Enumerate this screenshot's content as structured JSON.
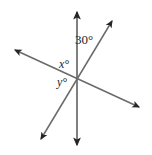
{
  "figure": {
    "background_color": "#ffffff",
    "line_color": "#6a6a6a",
    "arrow_color": "#262626",
    "text_color": "#262626",
    "width": 152,
    "height": 155
  },
  "labels": {
    "known_angle": "30°",
    "unknown_angle_x": "x°",
    "unknown_angle_y": "y°"
  },
  "geometry": {
    "intersection": {
      "x": 77,
      "y": 80
    },
    "lines": [
      {
        "name": "vertical-line",
        "x1": 77,
        "y1": 12,
        "x2": 77,
        "y2": 145,
        "arrows": "both"
      },
      {
        "name": "steep-diagonal-line",
        "x1": 41,
        "y1": 139,
        "x2": 112,
        "y2": 21,
        "arrows": "both"
      },
      {
        "name": "shallow-diagonal-line",
        "x1": 15,
        "y1": 50,
        "x2": 139,
        "y2": 107,
        "arrows": "both"
      }
    ]
  }
}
